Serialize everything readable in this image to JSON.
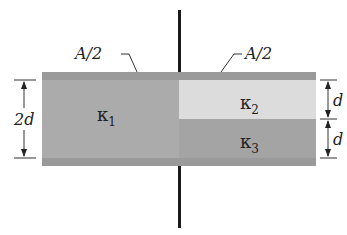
{
  "diagram": {
    "type": "parallel-plate capacitor with three dielectrics",
    "labels": {
      "area_left": "A/2",
      "area_right": "A/2",
      "gap_total": "2d",
      "gap_upper": "d",
      "gap_lower": "d",
      "kappa1": "κ",
      "kappa1_sub": "1",
      "kappa2": "κ",
      "kappa2_sub": "2",
      "kappa3": "κ",
      "kappa3_sub": "3"
    },
    "colors": {
      "plate": "#9a9a9a",
      "kappa1": "#ababab",
      "kappa2": "#dcdcdc",
      "kappa3": "#a4a4a4",
      "wire": "#1a1a1a"
    }
  }
}
